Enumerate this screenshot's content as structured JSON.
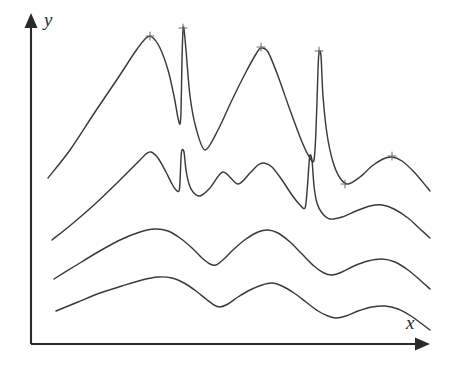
{
  "figure": {
    "background_color": "#ffffff",
    "ink_color": "#3a3a3a",
    "axis_color": "#2a2a2a",
    "marker_color": "#6d6d6d"
  },
  "axes": {
    "y_label": "y",
    "x_label": "x",
    "origin_x": 31,
    "origin_y": 344,
    "y_axis_top": 13,
    "x_axis_right": 430,
    "y_arrow_name": "y-axis-arrowhead",
    "x_arrow_name": "x-axis-arrowhead"
  },
  "chart_data": {
    "type": "line",
    "title": "",
    "xlabel": "x",
    "ylabel": "y",
    "grid": false,
    "legend": "none",
    "axis_ticks": false,
    "xlim": [
      31,
      430
    ],
    "ylim": [
      13,
      344
    ],
    "note": "Four stacked spectrum-like traces; vertical position is in screen pixels (y grows downward). Upper two traces contain very narrow tall spikes; lower two are smooth broad waves.",
    "series": [
      {
        "name": "trace-1",
        "description": "Topmost trace: broad peak, narrow spike, broad peak, narrow spike, small bump",
        "points": [
          [
            48,
            178
          ],
          [
            70,
            150
          ],
          [
            95,
            112
          ],
          [
            118,
            78
          ],
          [
            135,
            52
          ],
          [
            146,
            38
          ],
          [
            152,
            37
          ],
          [
            160,
            48
          ],
          [
            168,
            70
          ],
          [
            174,
            96
          ],
          [
            178,
            118
          ],
          [
            180,
            124
          ],
          [
            181,
            112
          ],
          [
            182,
            60
          ],
          [
            183,
            30
          ],
          [
            184,
            29
          ],
          [
            186,
            50
          ],
          [
            190,
            96
          ],
          [
            196,
            128
          ],
          [
            205,
            150
          ],
          [
            218,
            130
          ],
          [
            232,
            100
          ],
          [
            246,
            72
          ],
          [
            256,
            54
          ],
          [
            261,
            48
          ],
          [
            268,
            52
          ],
          [
            278,
            76
          ],
          [
            290,
            110
          ],
          [
            302,
            142
          ],
          [
            310,
            158
          ],
          [
            314,
            160
          ],
          [
            316,
            130
          ],
          [
            318,
            70
          ],
          [
            319,
            52
          ],
          [
            321,
            56
          ],
          [
            323,
            96
          ],
          [
            327,
            134
          ],
          [
            333,
            162
          ],
          [
            340,
            178
          ],
          [
            348,
            184
          ],
          [
            360,
            177
          ],
          [
            372,
            166
          ],
          [
            383,
            159
          ],
          [
            392,
            157
          ],
          [
            402,
            161
          ],
          [
            414,
            172
          ],
          [
            426,
            186
          ],
          [
            430,
            191
          ]
        ],
        "peak_markers": [
          [
            150,
            36
          ],
          [
            183,
            28
          ],
          [
            261,
            47
          ],
          [
            319,
            51
          ],
          [
            392,
            156
          ],
          [
            345,
            184
          ]
        ]
      },
      {
        "name": "trace-2",
        "description": "Second trace: same features, lower amplitude",
        "points": [
          [
            52,
            240
          ],
          [
            72,
            224
          ],
          [
            95,
            204
          ],
          [
            118,
            182
          ],
          [
            136,
            164
          ],
          [
            146,
            154
          ],
          [
            151,
            152
          ],
          [
            158,
            158
          ],
          [
            166,
            172
          ],
          [
            172,
            184
          ],
          [
            176,
            190
          ],
          [
            179,
            191
          ],
          [
            180,
            182
          ],
          [
            181,
            158
          ],
          [
            182,
            150
          ],
          [
            184,
            152
          ],
          [
            186,
            170
          ],
          [
            189,
            184
          ],
          [
            193,
            192
          ],
          [
            200,
            196
          ],
          [
            210,
            188
          ],
          [
            223,
            172
          ],
          [
            238,
            184
          ],
          [
            250,
            173
          ],
          [
            258,
            165
          ],
          [
            264,
            163
          ],
          [
            272,
            167
          ],
          [
            282,
            180
          ],
          [
            292,
            195
          ],
          [
            300,
            205
          ],
          [
            305,
            208
          ],
          [
            307,
            192
          ],
          [
            309,
            164
          ],
          [
            310,
            155
          ],
          [
            312,
            160
          ],
          [
            314,
            186
          ],
          [
            317,
            203
          ],
          [
            322,
            213
          ],
          [
            330,
            219
          ],
          [
            342,
            217
          ],
          [
            356,
            211
          ],
          [
            370,
            206
          ],
          [
            382,
            205
          ],
          [
            394,
            209
          ],
          [
            408,
            218
          ],
          [
            420,
            229
          ],
          [
            430,
            238
          ]
        ],
        "peak_markers": []
      },
      {
        "name": "trace-3",
        "description": "Third trace: smooth broad waves, no spikes",
        "points": [
          [
            54,
            279
          ],
          [
            75,
            266
          ],
          [
            98,
            252
          ],
          [
            120,
            240
          ],
          [
            140,
            232
          ],
          [
            155,
            229
          ],
          [
            168,
            231
          ],
          [
            180,
            238
          ],
          [
            192,
            248
          ],
          [
            202,
            258
          ],
          [
            210,
            264
          ],
          [
            216,
            265
          ],
          [
            224,
            259
          ],
          [
            234,
            249
          ],
          [
            246,
            239
          ],
          [
            258,
            232
          ],
          [
            268,
            230
          ],
          [
            278,
            233
          ],
          [
            290,
            242
          ],
          [
            302,
            254
          ],
          [
            314,
            266
          ],
          [
            324,
            273
          ],
          [
            332,
            275
          ],
          [
            342,
            272
          ],
          [
            354,
            266
          ],
          [
            368,
            261
          ],
          [
            382,
            259
          ],
          [
            395,
            262
          ],
          [
            408,
            270
          ],
          [
            420,
            280
          ],
          [
            430,
            289
          ]
        ],
        "peak_markers": []
      },
      {
        "name": "trace-4",
        "description": "Bottom trace: smoothest, lowest amplitude waves",
        "points": [
          [
            56,
            311
          ],
          [
            78,
            302
          ],
          [
            100,
            293
          ],
          [
            122,
            286
          ],
          [
            142,
            280
          ],
          [
            158,
            277
          ],
          [
            172,
            278
          ],
          [
            184,
            283
          ],
          [
            196,
            291
          ],
          [
            206,
            299
          ],
          [
            214,
            305
          ],
          [
            220,
            307
          ],
          [
            228,
            304
          ],
          [
            238,
            297
          ],
          [
            250,
            290
          ],
          [
            262,
            285
          ],
          [
            272,
            283
          ],
          [
            282,
            286
          ],
          [
            294,
            293
          ],
          [
            306,
            302
          ],
          [
            318,
            311
          ],
          [
            328,
            316
          ],
          [
            336,
            318
          ],
          [
            346,
            316
          ],
          [
            358,
            311
          ],
          [
            372,
            307
          ],
          [
            385,
            306
          ],
          [
            398,
            309
          ],
          [
            411,
            316
          ],
          [
            422,
            324
          ],
          [
            430,
            330
          ]
        ],
        "peak_markers": []
      }
    ]
  }
}
